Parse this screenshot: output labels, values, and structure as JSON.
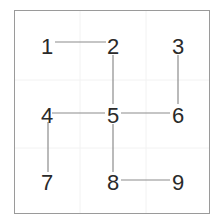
{
  "diagram": {
    "type": "grid-path",
    "nodes": [
      {
        "label": "1",
        "x": 47,
        "y": 46
      },
      {
        "label": "2",
        "x": 113,
        "y": 46
      },
      {
        "label": "3",
        "x": 178,
        "y": 46
      },
      {
        "label": "4",
        "x": 47,
        "y": 115
      },
      {
        "label": "5",
        "x": 113,
        "y": 115
      },
      {
        "label": "6",
        "x": 178,
        "y": 115
      },
      {
        "label": "7",
        "x": 47,
        "y": 182
      },
      {
        "label": "8",
        "x": 113,
        "y": 182
      },
      {
        "label": "9",
        "x": 178,
        "y": 182
      }
    ],
    "edges": [
      [
        "1",
        "2"
      ],
      [
        "2",
        "5"
      ],
      [
        "3",
        "6"
      ],
      [
        "4",
        "5"
      ],
      [
        "5",
        "6"
      ],
      [
        "4",
        "7"
      ],
      [
        "5",
        "8"
      ],
      [
        "8",
        "9"
      ]
    ],
    "colors": {
      "border": "#9a9a9a",
      "edge": "#8c8c8c",
      "text": "#2a2a2a",
      "gridline": "#f0f0f0"
    }
  }
}
